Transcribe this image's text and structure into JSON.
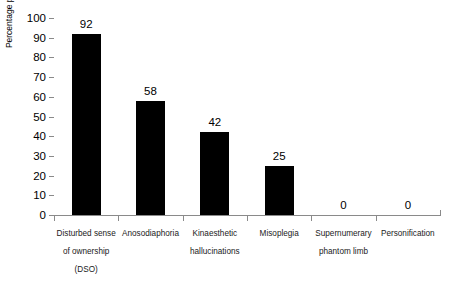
{
  "chart_data": {
    "type": "bar",
    "title": "",
    "xlabel": "",
    "ylabel": "Percentage present",
    "ylim": [
      0,
      100
    ],
    "ytick_step": 10,
    "grid": false,
    "legend": "none",
    "bar_color": "#000000",
    "axis_color": "#8a8a8a",
    "categories": [
      "Disturbed sense of ownership (DSO)",
      "Anosodiaphoria",
      "Kinaesthetic hallucinations",
      "Misoplegia",
      "Supernumerary phantom limb",
      "Personification"
    ],
    "category_lines": [
      [
        "Disturbed sense",
        "of ownership",
        "(DSO)"
      ],
      [
        "Anosodiaphoria"
      ],
      [
        "Kinaesthetic",
        "hallucinations"
      ],
      [
        "Misoplegia"
      ],
      [
        "Supernumerary",
        "phantom limb"
      ],
      [
        "Personification"
      ]
    ],
    "values": [
      92,
      58,
      42,
      25,
      0,
      0
    ],
    "value_labels": [
      "92",
      "58",
      "42",
      "25",
      "0",
      "0"
    ],
    "ytick_labels": [
      "100",
      "90",
      "80",
      "70",
      "60",
      "50",
      "40",
      "30",
      "20",
      "10",
      "0"
    ],
    "ytick_values": [
      100,
      90,
      80,
      70,
      60,
      50,
      40,
      30,
      20,
      10,
      0
    ]
  }
}
